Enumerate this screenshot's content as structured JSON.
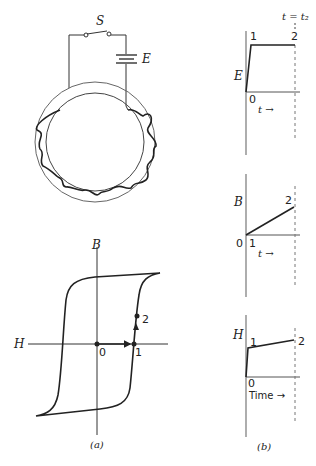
{
  "figure_a": {
    "circuit": {
      "switch_label": "S",
      "battery_label": "E"
    },
    "hysteresis": {
      "y_axis_label": "B",
      "x_axis_label": "H",
      "origin_label": "0",
      "point_1_label": "1",
      "point_2_label": "2"
    },
    "caption": "(a)"
  },
  "figure_b": {
    "top_label": "t = t₂",
    "plot_E": {
      "y_label": "E",
      "origin": "0",
      "p1": "1",
      "p2": "2",
      "x_label": "t →"
    },
    "plot_B": {
      "y_label": "B",
      "origin": "0",
      "p1": "1",
      "p2": "2",
      "x_label": "t →"
    },
    "plot_H": {
      "y_label": "H",
      "origin": "0",
      "p1": "1",
      "p2": "2",
      "x_label": "Time →"
    },
    "caption": "(b)"
  }
}
